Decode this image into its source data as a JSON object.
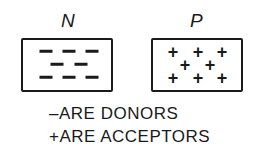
{
  "diagram": {
    "n_region": {
      "label": "N",
      "carrier_symbol": "-",
      "rows": [
        3,
        2,
        3
      ]
    },
    "p_region": {
      "label": "P",
      "carrier_symbol": "+",
      "rows": [
        3,
        2,
        3
      ]
    },
    "legend": [
      {
        "text": "–ARE DONORS"
      },
      {
        "text": "+ARE ACCEPTORS"
      }
    ]
  }
}
